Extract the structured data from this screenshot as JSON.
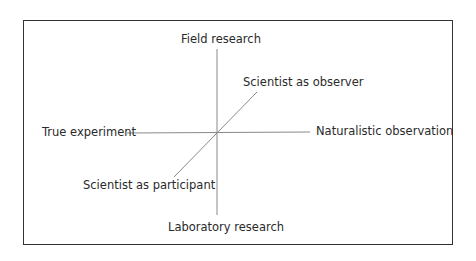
{
  "diagram": {
    "type": "three-dimension axis diagram",
    "colors": {
      "frame": "#333333",
      "axis_lines": "#8a8a8a",
      "text": "#2a2a2a",
      "background": "#ffffff"
    },
    "axes": {
      "vertical": {
        "top_label": "Field research",
        "bottom_label": "Laboratory research"
      },
      "horizontal": {
        "left_label": "True experiment",
        "right_label": "Naturalistic observation"
      },
      "diagonal": {
        "upper_label": "Scientist as observer",
        "lower_label": "Scientist as participant"
      }
    }
  }
}
